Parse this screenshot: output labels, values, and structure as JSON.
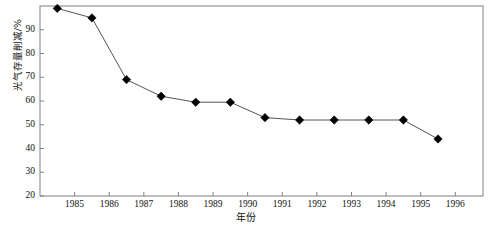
{
  "chart_data": {
    "type": "line",
    "title": "",
    "subtitle": "",
    "xlabel": "年份",
    "ylabel": "光气存量削减/%",
    "xlim": [
      1984.0,
      1996.8
    ],
    "ylim": [
      20,
      100
    ],
    "grid": false,
    "legend": null,
    "marker": "diamond",
    "marker_color": "#000000",
    "line_color": "#555555",
    "frame_color": "#808080",
    "xticks": [
      1985,
      1986,
      1987,
      1988,
      1989,
      1990,
      1991,
      1992,
      1993,
      1994,
      1995,
      1996
    ],
    "xtick_labels": [
      "1985",
      "1986",
      "1987",
      "1988",
      "1989",
      "1990",
      "1991",
      "1992",
      "1993",
      "1994",
      "1995",
      "1996"
    ],
    "yticks": [
      20,
      30,
      40,
      50,
      60,
      70,
      80,
      90
    ],
    "ytick_labels": [
      "20",
      "30",
      "40",
      "50",
      "60",
      "70",
      "80",
      "90"
    ],
    "x": [
      1984.5,
      1985.5,
      1986.5,
      1987.5,
      1988.5,
      1989.5,
      1990.5,
      1991.5,
      1992.5,
      1993.5,
      1994.5,
      1995.5
    ],
    "values": [
      99,
      95,
      69,
      62,
      59.5,
      59.5,
      53,
      52,
      52,
      52,
      52,
      44
    ],
    "series": [
      {
        "name": "光气存量削减",
        "x": [
          1984.5,
          1985.5,
          1986.5,
          1987.5,
          1988.5,
          1989.5,
          1990.5,
          1991.5,
          1992.5,
          1993.5,
          1994.5,
          1995.5
        ],
        "values": [
          99,
          95,
          69,
          62,
          59.5,
          59.5,
          53,
          52,
          52,
          52,
          52,
          44
        ]
      }
    ]
  }
}
